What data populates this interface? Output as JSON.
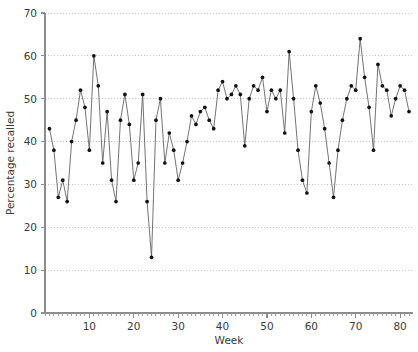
{
  "chart_data": {
    "type": "line",
    "title": "",
    "subtitle": "",
    "xlabel": "Week",
    "ylabel": "Percentage recalled",
    "xlim": [
      0,
      82
    ],
    "ylim": [
      0,
      70
    ],
    "xticks": [
      10,
      20,
      30,
      40,
      50,
      60,
      70,
      80
    ],
    "xtick_labels": [
      "10",
      "20",
      "30",
      "40",
      "50",
      "60",
      "70",
      "80"
    ],
    "xminor_tick_step": 1,
    "yticks": [
      0,
      10,
      20,
      30,
      40,
      50,
      60,
      70
    ],
    "ytick_labels": [
      "0",
      "10",
      "20",
      "30",
      "40",
      "50",
      "60",
      "70"
    ],
    "grid": "horizontal-dotted",
    "legend": "none",
    "marker": "filled-circle",
    "marker_color": "#111111",
    "line_color": "#5a5a5a",
    "series": [
      {
        "name": "Percentage recalled",
        "x": [
          1,
          2,
          3,
          4,
          5,
          6,
          7,
          8,
          9,
          10,
          11,
          12,
          13,
          14,
          15,
          16,
          17,
          18,
          19,
          20,
          21,
          22,
          23,
          24,
          25,
          26,
          27,
          28,
          29,
          30,
          31,
          32,
          33,
          34,
          35,
          36,
          37,
          38,
          39,
          40,
          41,
          42,
          43,
          44,
          45,
          46,
          47,
          48,
          49,
          50,
          51,
          52,
          53,
          54,
          55,
          56,
          57,
          58,
          59,
          60,
          61,
          62,
          63,
          64,
          65,
          66,
          67,
          68,
          69,
          70,
          71,
          72,
          73,
          74,
          75,
          76,
          77,
          78,
          79,
          80,
          81,
          82
        ],
        "values": [
          43,
          38,
          27,
          31,
          26,
          40,
          45,
          52,
          48,
          38,
          60,
          53,
          35,
          47,
          31,
          26,
          45,
          51,
          44,
          31,
          35,
          51,
          26,
          13,
          45,
          50,
          35,
          42,
          38,
          31,
          35,
          40,
          46,
          44,
          47,
          48,
          45,
          43,
          52,
          54,
          50,
          51,
          53,
          51,
          39,
          50,
          53,
          52,
          55,
          47,
          52,
          50,
          52,
          42,
          61,
          50,
          38,
          31,
          28,
          47,
          53,
          49,
          43,
          35,
          27,
          38,
          45,
          50,
          53,
          52,
          64,
          55,
          48,
          38,
          58,
          53,
          52,
          46,
          50,
          53,
          52,
          47
        ]
      }
    ]
  }
}
